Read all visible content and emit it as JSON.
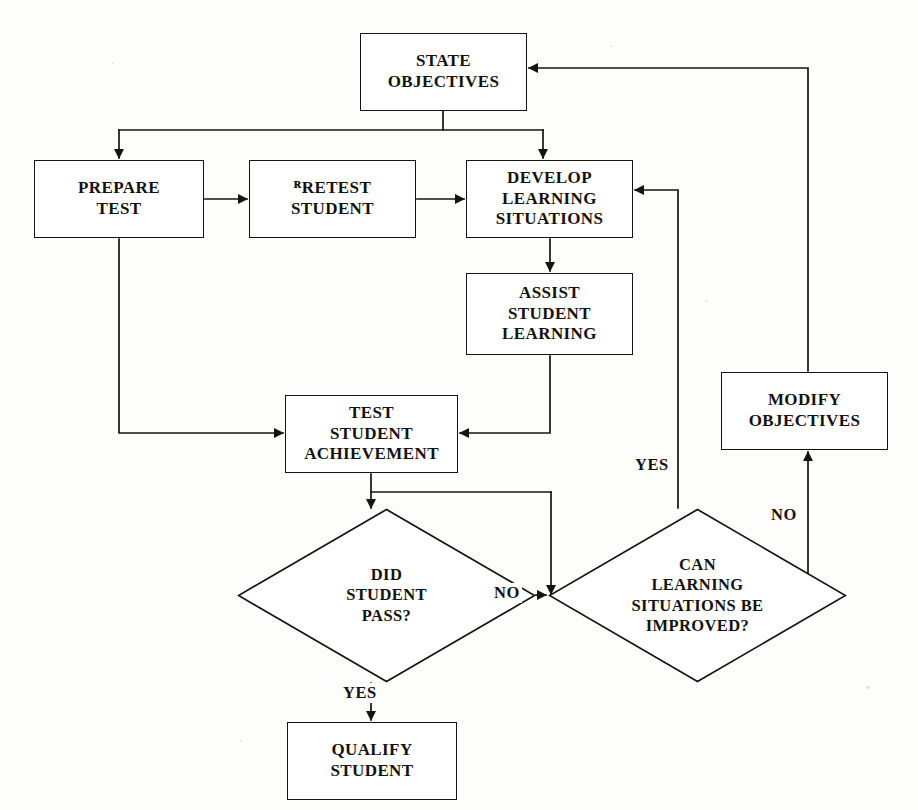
{
  "diagram": {
    "type": "flowchart",
    "background_color": "#fdfdfb",
    "line_color": "#17140f",
    "text_color": "#15120e",
    "nodes": [
      {
        "id": "state-objectives",
        "shape": "process",
        "label": "STATE\nOBJECTIVES",
        "x": 360,
        "y": 33,
        "w": 167,
        "h": 78
      },
      {
        "id": "prepare-test",
        "shape": "process",
        "label": "PREPARE\nTEST",
        "x": 34,
        "y": 160,
        "w": 170,
        "h": 78
      },
      {
        "id": "pretest-student",
        "shape": "process",
        "label": "ᴿRETEST\nSTUDENT",
        "x": 249,
        "y": 160,
        "w": 167,
        "h": 78
      },
      {
        "id": "develop-learning-situations",
        "shape": "process",
        "label": "DEVELOP\nLEARNING\nSITUATIONS",
        "x": 466,
        "y": 160,
        "w": 167,
        "h": 78
      },
      {
        "id": "assist-student-learning",
        "shape": "process",
        "label": "ASSIST\nSTUDENT\nLEARNING",
        "x": 466,
        "y": 273,
        "w": 167,
        "h": 82
      },
      {
        "id": "modify-objectives",
        "shape": "process",
        "label": "MODIFY\nOBJECTIVES",
        "x": 721,
        "y": 372,
        "w": 167,
        "h": 78
      },
      {
        "id": "test-student-achievement",
        "shape": "process",
        "label": "TEST\nSTUDENT\nACHIEVEMENT",
        "x": 285,
        "y": 395,
        "w": 173,
        "h": 78
      },
      {
        "id": "did-student-pass",
        "shape": "decision",
        "label": "DID\nSTUDENT\nPASS?",
        "x": 237,
        "y": 508,
        "w": 299,
        "h": 175
      },
      {
        "id": "can-learning-situations-be-improved",
        "shape": "decision",
        "label": "CAN\nLEARNING\nSITUATIONS BE\nIMPROVED?",
        "x": 548,
        "y": 508,
        "w": 299,
        "h": 175
      },
      {
        "id": "qualify-student",
        "shape": "process",
        "label": "QUALIFY\nSTUDENT",
        "x": 287,
        "y": 722,
        "w": 170,
        "h": 78
      }
    ],
    "edge_labels": [
      {
        "id": "no-pass",
        "text": "NO",
        "x": 492,
        "y": 583
      },
      {
        "id": "yes-pass",
        "text": "YES",
        "x": 341,
        "y": 683
      },
      {
        "id": "yes-improve",
        "text": "YES",
        "x": 655,
        "y": 458
      },
      {
        "id": "no-improve",
        "text": "NO",
        "x": 787,
        "y": 508
      }
    ],
    "edges": [
      {
        "from": "state-objectives",
        "to": "prepare-test",
        "label": ""
      },
      {
        "from": "state-objectives",
        "to": "develop-learning-situations",
        "label": ""
      },
      {
        "from": "prepare-test",
        "to": "pretest-student",
        "label": ""
      },
      {
        "from": "pretest-student",
        "to": "develop-learning-situations",
        "label": ""
      },
      {
        "from": "prepare-test",
        "to": "test-student-achievement",
        "label": ""
      },
      {
        "from": "develop-learning-situations",
        "to": "assist-student-learning",
        "label": ""
      },
      {
        "from": "assist-student-learning",
        "to": "test-student-achievement",
        "label": ""
      },
      {
        "from": "test-student-achievement",
        "to": "did-student-pass",
        "label": ""
      },
      {
        "from": "test-student-achievement",
        "to": "can-learning-situations-be-improved",
        "label": ""
      },
      {
        "from": "did-student-pass",
        "to": "qualify-student",
        "label": "YES"
      },
      {
        "from": "did-student-pass",
        "to": "can-learning-situations-be-improved",
        "label": "NO"
      },
      {
        "from": "can-learning-situations-be-improved",
        "to": "develop-learning-situations",
        "label": "YES"
      },
      {
        "from": "can-learning-situations-be-improved",
        "to": "modify-objectives",
        "label": "NO"
      },
      {
        "from": "modify-objectives",
        "to": "state-objectives",
        "label": ""
      }
    ]
  }
}
